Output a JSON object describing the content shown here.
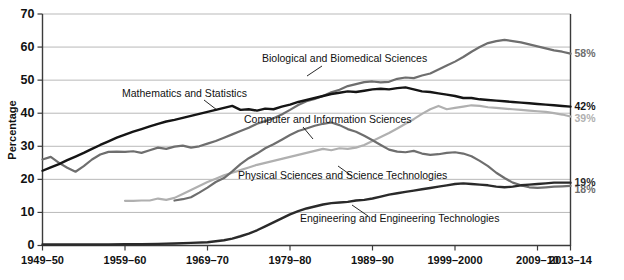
{
  "chart_data": {
    "type": "line",
    "title": "",
    "xlabel": "",
    "ylabel": "Percentage",
    "ylim": [
      0,
      70
    ],
    "ytick_step": 10,
    "grid": true,
    "legend_position": "inline-annotations",
    "yticks": [
      "0",
      "10",
      "20",
      "30",
      "40",
      "50",
      "60",
      "70"
    ],
    "categories": [
      "1949–50",
      "1959–60",
      "1969–70",
      "1979–80",
      "1989–90",
      "1999–2000",
      "2009–10",
      "2013–14"
    ],
    "x_years": [
      1950,
      1960,
      1970,
      1980,
      1990,
      2000,
      2010,
      2014
    ],
    "series": [
      {
        "name": "Biological and Biomedical Sciences",
        "color": "#6e6e6e",
        "end_label": "58%",
        "end_value": 58,
        "x": [
          1950,
          1951,
          1952,
          1953,
          1954,
          1955,
          1956,
          1957,
          1958,
          1959,
          1960,
          1961,
          1962,
          1963,
          1964,
          1965,
          1966,
          1967,
          1968,
          1969,
          1970,
          1971,
          1972,
          1973,
          1974,
          1975,
          1976,
          1977,
          1978,
          1979,
          1980,
          1981,
          1982,
          1983,
          1984,
          1985,
          1986,
          1987,
          1988,
          1989,
          1990,
          1991,
          1992,
          1993,
          1994,
          1995,
          1996,
          1997,
          1998,
          1999,
          2000,
          2001,
          2002,
          2003,
          2004,
          2005,
          2006,
          2007,
          2008,
          2009,
          2010,
          2011,
          2012,
          2013,
          2014
        ],
        "values": [
          26.0,
          26.8,
          25.0,
          23.5,
          22.3,
          24.0,
          26.0,
          27.5,
          28.3,
          28.4,
          28.3,
          28.5,
          28.0,
          28.8,
          29.6,
          29.2,
          29.9,
          30.2,
          29.6,
          30.0,
          30.8,
          31.6,
          32.6,
          33.6,
          34.6,
          35.6,
          36.8,
          37.6,
          38.5,
          39.6,
          41.0,
          42.5,
          43.6,
          44.3,
          45.2,
          46.3,
          47.1,
          48.2,
          48.8,
          49.4,
          49.6,
          49.3,
          49.5,
          50.4,
          50.8,
          50.6,
          51.4,
          52.0,
          53.2,
          54.4,
          55.6,
          57.0,
          58.6,
          60.0,
          61.2,
          61.8,
          62.2,
          61.8,
          61.4,
          60.8,
          60.2,
          59.6,
          59.0,
          58.6,
          58.0
        ]
      },
      {
        "name": "Mathematics and Statistics",
        "color": "#151515",
        "end_label": "42%",
        "end_value": 42,
        "x": [
          1950,
          1951,
          1952,
          1953,
          1954,
          1955,
          1956,
          1957,
          1958,
          1959,
          1960,
          1961,
          1962,
          1963,
          1964,
          1965,
          1966,
          1967,
          1968,
          1969,
          1970,
          1971,
          1972,
          1973,
          1974,
          1975,
          1976,
          1977,
          1978,
          1979,
          1980,
          1981,
          1982,
          1983,
          1984,
          1985,
          1986,
          1987,
          1988,
          1989,
          1990,
          1991,
          1992,
          1993,
          1994,
          1995,
          1996,
          1997,
          1998,
          1999,
          2000,
          2001,
          2002,
          2003,
          2004,
          2005,
          2006,
          2007,
          2008,
          2009,
          2010,
          2011,
          2012,
          2013,
          2014
        ],
        "values": [
          22.6,
          23.6,
          24.6,
          25.8,
          26.9,
          28.0,
          29.2,
          30.4,
          31.5,
          32.6,
          33.5,
          34.4,
          35.2,
          36.0,
          36.8,
          37.5,
          38.0,
          38.6,
          39.2,
          39.8,
          40.4,
          41.0,
          41.6,
          42.2,
          41.0,
          41.2,
          40.8,
          41.4,
          41.2,
          42.0,
          42.6,
          43.4,
          44.0,
          44.6,
          45.2,
          45.8,
          46.2,
          46.6,
          46.4,
          46.8,
          47.2,
          47.4,
          47.2,
          47.6,
          47.8,
          47.2,
          46.6,
          46.4,
          46.0,
          45.6,
          45.2,
          44.6,
          44.6,
          44.2,
          44.0,
          43.8,
          43.6,
          43.4,
          43.2,
          43.0,
          42.8,
          42.6,
          42.4,
          42.2,
          42.0
        ]
      },
      {
        "name": "Physical Sciences and Science Technologies",
        "color": "#b0b0b0",
        "end_label": "39%",
        "end_value": 39,
        "x": [
          1960,
          1961,
          1962,
          1963,
          1964,
          1965,
          1966,
          1967,
          1968,
          1969,
          1970,
          1971,
          1972,
          1973,
          1974,
          1975,
          1976,
          1977,
          1978,
          1979,
          1980,
          1981,
          1982,
          1983,
          1984,
          1985,
          1986,
          1987,
          1988,
          1989,
          1990,
          1991,
          1992,
          1993,
          1994,
          1995,
          1996,
          1997,
          1998,
          1999,
          2000,
          2001,
          2002,
          2003,
          2004,
          2005,
          2006,
          2007,
          2008,
          2009,
          2010,
          2011,
          2012,
          2013,
          2014
        ],
        "values": [
          13.5,
          13.5,
          13.6,
          13.6,
          14.2,
          13.8,
          14.4,
          15.6,
          16.8,
          18.0,
          19.2,
          20.2,
          21.2,
          22.0,
          22.8,
          23.6,
          24.4,
          25.0,
          25.6,
          26.2,
          26.8,
          27.4,
          28.0,
          28.6,
          29.2,
          28.8,
          29.4,
          29.2,
          29.6,
          30.4,
          31.6,
          32.8,
          34.0,
          35.4,
          36.8,
          38.2,
          39.8,
          41.2,
          42.2,
          41.2,
          41.6,
          42.0,
          42.4,
          42.2,
          41.8,
          41.6,
          41.4,
          41.2,
          41.0,
          40.8,
          40.6,
          40.4,
          40.0,
          39.6,
          39.0
        ]
      },
      {
        "name": "Computer and Information Sciences",
        "color": "#6e6e6e",
        "end_label": "18%",
        "end_value": 18,
        "x": [
          1966,
          1967,
          1968,
          1969,
          1970,
          1971,
          1972,
          1973,
          1974,
          1975,
          1976,
          1977,
          1978,
          1979,
          1980,
          1981,
          1982,
          1983,
          1984,
          1985,
          1986,
          1987,
          1988,
          1989,
          1990,
          1991,
          1992,
          1993,
          1994,
          1995,
          1996,
          1997,
          1998,
          1999,
          2000,
          2001,
          2002,
          2003,
          2004,
          2005,
          2006,
          2007,
          2008,
          2009,
          2010,
          2011,
          2012,
          2013,
          2014
        ],
        "values": [
          13.6,
          14.0,
          14.6,
          16.0,
          17.5,
          19.2,
          20.4,
          22.4,
          24.6,
          26.4,
          27.8,
          29.4,
          30.6,
          32.0,
          33.4,
          34.6,
          35.4,
          36.2,
          36.8,
          37.2,
          36.4,
          35.2,
          34.4,
          33.2,
          31.8,
          30.4,
          29.0,
          28.4,
          28.2,
          28.6,
          27.8,
          27.4,
          27.6,
          28.0,
          28.2,
          27.8,
          27.0,
          25.6,
          24.0,
          22.0,
          20.4,
          19.0,
          18.2,
          17.6,
          17.4,
          17.6,
          17.8,
          17.9,
          18.0
        ]
      },
      {
        "name": "Engineering and Engineering Technologies",
        "color": "#2a2a2a",
        "end_label": "19%",
        "end_value": 19,
        "x": [
          1950,
          1952,
          1954,
          1956,
          1958,
          1960,
          1962,
          1964,
          1966,
          1968,
          1970,
          1971,
          1972,
          1973,
          1974,
          1975,
          1976,
          1977,
          1978,
          1979,
          1980,
          1981,
          1982,
          1983,
          1984,
          1985,
          1986,
          1987,
          1988,
          1989,
          1990,
          1991,
          1992,
          1993,
          1994,
          1995,
          1996,
          1997,
          1998,
          1999,
          2000,
          2001,
          2002,
          2003,
          2004,
          2005,
          2006,
          2007,
          2008,
          2009,
          2010,
          2011,
          2012,
          2013,
          2014
        ],
        "values": [
          0.3,
          0.3,
          0.3,
          0.3,
          0.3,
          0.4,
          0.4,
          0.5,
          0.6,
          0.8,
          1.0,
          1.3,
          1.6,
          2.1,
          2.8,
          3.6,
          4.6,
          5.8,
          7.0,
          8.2,
          9.4,
          10.4,
          11.2,
          11.8,
          12.4,
          12.8,
          13.0,
          13.2,
          13.6,
          13.8,
          14.2,
          14.8,
          15.4,
          15.8,
          16.2,
          16.6,
          17.0,
          17.4,
          17.8,
          18.2,
          18.6,
          18.8,
          18.6,
          18.4,
          18.2,
          17.8,
          17.6,
          17.8,
          18.2,
          18.4,
          18.6,
          18.8,
          19.0,
          19.0,
          19.0
        ]
      }
    ],
    "annotations": [
      {
        "name": "biological-and-biomedical-sciences",
        "text": "Biological and Biomedical Sciences",
        "text_x": 262,
        "text_y": 62,
        "leader": "M 322 66 L 307 76"
      },
      {
        "name": "mathematics-and-statistics",
        "text": "Mathematics and Statistics",
        "text_x": 122,
        "text_y": 97,
        "leader": "M 204 100 L 217 110"
      },
      {
        "name": "computer-and-information-sciences",
        "text": "Computer and Information Sciences",
        "text_x": 244,
        "text_y": 123,
        "leader": "M 303 127 L 313 139"
      },
      {
        "name": "physical-sciences-and-science-technologies",
        "text": "Physical Sciences and Science Technologies",
        "text_x": 238,
        "text_y": 179,
        "leader": "M 338 166 L 352 176"
      },
      {
        "name": "engineering-and-engineering-technologies",
        "text": "Engineering and Engineering Technologies",
        "text_x": 300,
        "text_y": 222,
        "leader": "M 352 205 L 368 216"
      }
    ]
  }
}
